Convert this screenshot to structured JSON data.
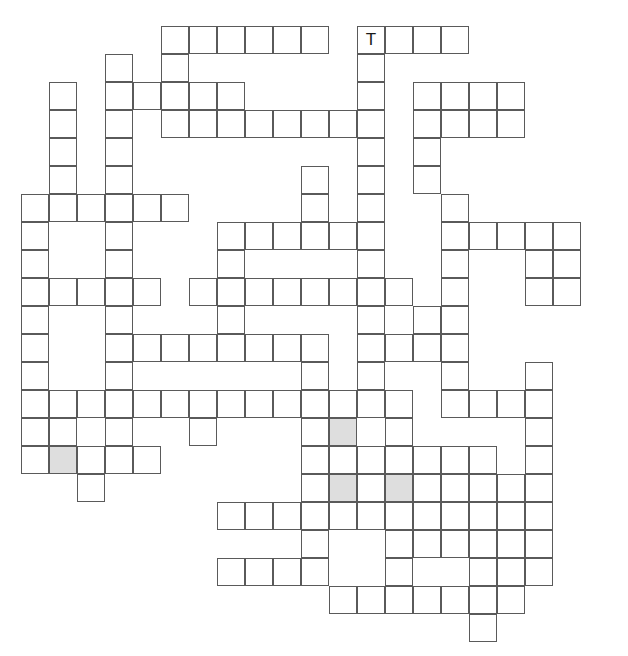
{
  "puzzle": {
    "kind": "crossword-grid",
    "title": "Crossword Puzzle Grid",
    "geometry": {
      "origin_x": 21,
      "origin_y": 26,
      "cell_size": 28,
      "columns": 21,
      "rows": 22,
      "line_color": "#5a5a5a",
      "cell_fill": "#ffffff",
      "shaded_fill": "#dedede",
      "page_background": "#ffffff"
    },
    "letters": [
      {
        "row": 0,
        "col": 12,
        "text": "T"
      }
    ],
    "shaded_cells": [
      {
        "row": 15,
        "col": 1
      },
      {
        "row": 14,
        "col": 11
      },
      {
        "row": 16,
        "col": 11
      },
      {
        "row": 16,
        "col": 13
      }
    ],
    "cells": [
      {
        "row": 0,
        "col": 5
      },
      {
        "row": 0,
        "col": 6
      },
      {
        "row": 0,
        "col": 7
      },
      {
        "row": 0,
        "col": 8
      },
      {
        "row": 0,
        "col": 9
      },
      {
        "row": 0,
        "col": 10
      },
      {
        "row": 0,
        "col": 12
      },
      {
        "row": 0,
        "col": 13
      },
      {
        "row": 0,
        "col": 14
      },
      {
        "row": 0,
        "col": 15
      },
      {
        "row": 1,
        "col": 3
      },
      {
        "row": 1,
        "col": 5
      },
      {
        "row": 1,
        "col": 12
      },
      {
        "row": 2,
        "col": 1
      },
      {
        "row": 2,
        "col": 3
      },
      {
        "row": 2,
        "col": 4
      },
      {
        "row": 2,
        "col": 5
      },
      {
        "row": 2,
        "col": 6
      },
      {
        "row": 2,
        "col": 7
      },
      {
        "row": 2,
        "col": 12
      },
      {
        "row": 2,
        "col": 14
      },
      {
        "row": 2,
        "col": 15
      },
      {
        "row": 2,
        "col": 16
      },
      {
        "row": 2,
        "col": 17
      },
      {
        "row": 3,
        "col": 1
      },
      {
        "row": 3,
        "col": 3
      },
      {
        "row": 3,
        "col": 5
      },
      {
        "row": 3,
        "col": 6
      },
      {
        "row": 3,
        "col": 7
      },
      {
        "row": 3,
        "col": 8
      },
      {
        "row": 3,
        "col": 9
      },
      {
        "row": 3,
        "col": 10
      },
      {
        "row": 3,
        "col": 11
      },
      {
        "row": 3,
        "col": 12
      },
      {
        "row": 3,
        "col": 14
      },
      {
        "row": 3,
        "col": 15
      },
      {
        "row": 3,
        "col": 16
      },
      {
        "row": 3,
        "col": 17
      },
      {
        "row": 4,
        "col": 1
      },
      {
        "row": 4,
        "col": 3
      },
      {
        "row": 4,
        "col": 12
      },
      {
        "row": 4,
        "col": 14
      },
      {
        "row": 5,
        "col": 1
      },
      {
        "row": 5,
        "col": 3
      },
      {
        "row": 5,
        "col": 10
      },
      {
        "row": 5,
        "col": 12
      },
      {
        "row": 5,
        "col": 14
      },
      {
        "row": 6,
        "col": 0
      },
      {
        "row": 6,
        "col": 1
      },
      {
        "row": 6,
        "col": 2
      },
      {
        "row": 6,
        "col": 3
      },
      {
        "row": 6,
        "col": 4
      },
      {
        "row": 6,
        "col": 5
      },
      {
        "row": 6,
        "col": 10
      },
      {
        "row": 6,
        "col": 12
      },
      {
        "row": 6,
        "col": 15
      },
      {
        "row": 7,
        "col": 0
      },
      {
        "row": 7,
        "col": 3
      },
      {
        "row": 7,
        "col": 7
      },
      {
        "row": 7,
        "col": 8
      },
      {
        "row": 7,
        "col": 9
      },
      {
        "row": 7,
        "col": 10
      },
      {
        "row": 7,
        "col": 11
      },
      {
        "row": 7,
        "col": 12
      },
      {
        "row": 7,
        "col": 15
      },
      {
        "row": 7,
        "col": 16
      },
      {
        "row": 7,
        "col": 17
      },
      {
        "row": 7,
        "col": 18
      },
      {
        "row": 7,
        "col": 19
      },
      {
        "row": 8,
        "col": 0
      },
      {
        "row": 8,
        "col": 3
      },
      {
        "row": 8,
        "col": 7
      },
      {
        "row": 8,
        "col": 12
      },
      {
        "row": 8,
        "col": 15
      },
      {
        "row": 8,
        "col": 18
      },
      {
        "row": 8,
        "col": 19
      },
      {
        "row": 9,
        "col": 0
      },
      {
        "row": 9,
        "col": 1
      },
      {
        "row": 9,
        "col": 2
      },
      {
        "row": 9,
        "col": 3
      },
      {
        "row": 9,
        "col": 4
      },
      {
        "row": 9,
        "col": 6
      },
      {
        "row": 9,
        "col": 7
      },
      {
        "row": 9,
        "col": 8
      },
      {
        "row": 9,
        "col": 9
      },
      {
        "row": 9,
        "col": 10
      },
      {
        "row": 9,
        "col": 11
      },
      {
        "row": 9,
        "col": 12
      },
      {
        "row": 9,
        "col": 13
      },
      {
        "row": 9,
        "col": 15
      },
      {
        "row": 9,
        "col": 18
      },
      {
        "row": 9,
        "col": 19
      },
      {
        "row": 10,
        "col": 0
      },
      {
        "row": 10,
        "col": 3
      },
      {
        "row": 10,
        "col": 7
      },
      {
        "row": 10,
        "col": 12
      },
      {
        "row": 10,
        "col": 14
      },
      {
        "row": 10,
        "col": 15
      },
      {
        "row": 11,
        "col": 0
      },
      {
        "row": 11,
        "col": 3
      },
      {
        "row": 11,
        "col": 4
      },
      {
        "row": 11,
        "col": 5
      },
      {
        "row": 11,
        "col": 6
      },
      {
        "row": 11,
        "col": 7
      },
      {
        "row": 11,
        "col": 8
      },
      {
        "row": 11,
        "col": 9
      },
      {
        "row": 11,
        "col": 10
      },
      {
        "row": 11,
        "col": 12
      },
      {
        "row": 11,
        "col": 13
      },
      {
        "row": 11,
        "col": 14
      },
      {
        "row": 11,
        "col": 15
      },
      {
        "row": 12,
        "col": 0
      },
      {
        "row": 12,
        "col": 3
      },
      {
        "row": 12,
        "col": 10
      },
      {
        "row": 12,
        "col": 12
      },
      {
        "row": 12,
        "col": 15
      },
      {
        "row": 12,
        "col": 18
      },
      {
        "row": 13,
        "col": 0
      },
      {
        "row": 13,
        "col": 1
      },
      {
        "row": 13,
        "col": 2
      },
      {
        "row": 13,
        "col": 3
      },
      {
        "row": 13,
        "col": 4
      },
      {
        "row": 13,
        "col": 5
      },
      {
        "row": 13,
        "col": 6
      },
      {
        "row": 13,
        "col": 7
      },
      {
        "row": 13,
        "col": 8
      },
      {
        "row": 13,
        "col": 9
      },
      {
        "row": 13,
        "col": 10
      },
      {
        "row": 13,
        "col": 11
      },
      {
        "row": 13,
        "col": 12
      },
      {
        "row": 13,
        "col": 13
      },
      {
        "row": 13,
        "col": 15
      },
      {
        "row": 13,
        "col": 16
      },
      {
        "row": 13,
        "col": 17
      },
      {
        "row": 13,
        "col": 18
      },
      {
        "row": 14,
        "col": 0
      },
      {
        "row": 14,
        "col": 1
      },
      {
        "row": 14,
        "col": 3
      },
      {
        "row": 14,
        "col": 6
      },
      {
        "row": 14,
        "col": 10
      },
      {
        "row": 14,
        "col": 11
      },
      {
        "row": 14,
        "col": 13
      },
      {
        "row": 14,
        "col": 18
      },
      {
        "row": 15,
        "col": 0
      },
      {
        "row": 15,
        "col": 1
      },
      {
        "row": 15,
        "col": 2
      },
      {
        "row": 15,
        "col": 3
      },
      {
        "row": 15,
        "col": 4
      },
      {
        "row": 15,
        "col": 10
      },
      {
        "row": 15,
        "col": 11
      },
      {
        "row": 15,
        "col": 12
      },
      {
        "row": 15,
        "col": 13
      },
      {
        "row": 15,
        "col": 14
      },
      {
        "row": 15,
        "col": 15
      },
      {
        "row": 15,
        "col": 16
      },
      {
        "row": 15,
        "col": 18
      },
      {
        "row": 16,
        "col": 2
      },
      {
        "row": 16,
        "col": 10
      },
      {
        "row": 16,
        "col": 11
      },
      {
        "row": 16,
        "col": 12
      },
      {
        "row": 16,
        "col": 13
      },
      {
        "row": 16,
        "col": 14
      },
      {
        "row": 16,
        "col": 15
      },
      {
        "row": 16,
        "col": 16
      },
      {
        "row": 16,
        "col": 17
      },
      {
        "row": 16,
        "col": 18
      },
      {
        "row": 17,
        "col": 7
      },
      {
        "row": 17,
        "col": 8
      },
      {
        "row": 17,
        "col": 9
      },
      {
        "row": 17,
        "col": 10
      },
      {
        "row": 17,
        "col": 11
      },
      {
        "row": 17,
        "col": 12
      },
      {
        "row": 17,
        "col": 13
      },
      {
        "row": 17,
        "col": 14
      },
      {
        "row": 17,
        "col": 15
      },
      {
        "row": 17,
        "col": 16
      },
      {
        "row": 17,
        "col": 17
      },
      {
        "row": 17,
        "col": 18
      },
      {
        "row": 18,
        "col": 10
      },
      {
        "row": 18,
        "col": 13
      },
      {
        "row": 18,
        "col": 14
      },
      {
        "row": 18,
        "col": 15
      },
      {
        "row": 18,
        "col": 16
      },
      {
        "row": 18,
        "col": 17
      },
      {
        "row": 18,
        "col": 18
      },
      {
        "row": 19,
        "col": 7
      },
      {
        "row": 19,
        "col": 8
      },
      {
        "row": 19,
        "col": 9
      },
      {
        "row": 19,
        "col": 10
      },
      {
        "row": 19,
        "col": 13
      },
      {
        "row": 19,
        "col": 16
      },
      {
        "row": 19,
        "col": 17
      },
      {
        "row": 19,
        "col": 18
      },
      {
        "row": 20,
        "col": 11
      },
      {
        "row": 20,
        "col": 12
      },
      {
        "row": 20,
        "col": 13
      },
      {
        "row": 20,
        "col": 14
      },
      {
        "row": 20,
        "col": 15
      },
      {
        "row": 20,
        "col": 16
      },
      {
        "row": 20,
        "col": 17
      },
      {
        "row": 21,
        "col": 16
      }
    ]
  }
}
